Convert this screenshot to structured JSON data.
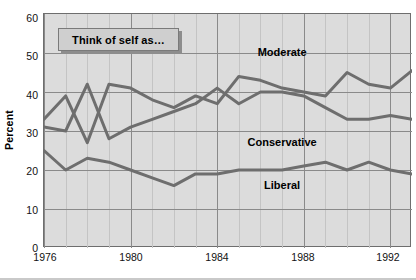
{
  "chart_data": {
    "type": "line",
    "title": "",
    "legend_caption": "Think of self as…",
    "xlabel": "",
    "ylabel": "Percent",
    "ylim": [
      0,
      60
    ],
    "yticks": [
      0,
      10,
      20,
      30,
      40,
      50,
      60
    ],
    "xlim": [
      1976,
      1993
    ],
    "xticks": [
      1976,
      1980,
      1984,
      1988,
      1992
    ],
    "xtick_labels": [
      "1976",
      "1980",
      "1984",
      "1988",
      "1992"
    ],
    "grid": true,
    "grid_minor_x": true,
    "legend_position": "inline-labels",
    "x": [
      1976,
      1977,
      1978,
      1979,
      1980,
      1981,
      1982,
      1983,
      1984,
      1985,
      1986,
      1987,
      1988,
      1989,
      1990,
      1991,
      1992,
      1993
    ],
    "series": [
      {
        "name": "Moderate",
        "color": "#6e6e6e",
        "values": [
          33,
          39,
          27,
          42,
          41,
          38,
          36,
          39,
          37,
          44,
          43,
          41,
          40,
          39,
          45,
          42,
          41,
          45.5
        ],
        "label_x": 1987,
        "label_y": 50
      },
      {
        "name": "Conservative",
        "color": "#6e6e6e",
        "values": [
          31,
          30,
          42,
          28,
          31,
          33,
          35,
          37,
          41,
          37,
          40,
          40,
          39,
          36,
          33,
          33,
          34,
          33
        ],
        "label_x": 1987,
        "label_y": 27
      },
      {
        "name": "Liberal",
        "color": "#6e6e6e",
        "values": [
          25,
          20,
          23,
          22,
          20,
          18,
          16,
          19,
          19,
          20,
          20,
          20,
          21,
          22,
          20,
          22,
          20,
          19
        ],
        "label_x": 1987,
        "label_y": 16
      }
    ]
  },
  "axis": {
    "ylabel": "Percent",
    "ytick_labels": [
      "60",
      "50",
      "40",
      "30",
      "20",
      "10",
      "0"
    ],
    "xtick_labels": [
      "1976",
      "1980",
      "1984",
      "1988",
      "1992"
    ]
  },
  "legend": {
    "caption": "Think of self as…"
  },
  "colors": {
    "plot_background": "#dcdcdc",
    "page_background": "#ffffff",
    "line": "#6e6e6e",
    "gridline_major": "#8a8a8a",
    "gridline_minor": "#c4c4c4",
    "frame": "#6e6e6e",
    "text": "#111111",
    "legend_fill": "#cfcfcf",
    "legend_shadow": "#8d8d8d"
  }
}
